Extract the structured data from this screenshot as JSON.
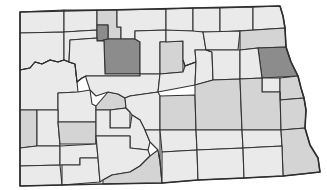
{
  "map": {
    "title": "North Dakota county choropleth",
    "legend_shown": false,
    "labels_shown": false,
    "colors": {
      "level0": "#eaeaea",
      "level1": "#d4d4d4",
      "level2": "#8c8c8c",
      "border": "#333333",
      "background": "#ffffff"
    },
    "counties": [
      {
        "id": "divide",
        "shade": "level0"
      },
      {
        "id": "burke",
        "shade": "level0"
      },
      {
        "id": "renville",
        "shade": "level1"
      },
      {
        "id": "bottineau",
        "shade": "level0"
      },
      {
        "id": "rolette",
        "shade": "level0"
      },
      {
        "id": "towner",
        "shade": "level0"
      },
      {
        "id": "cavalier",
        "shade": "level0"
      },
      {
        "id": "pembina",
        "shade": "level0"
      },
      {
        "id": "williams",
        "shade": "level0"
      },
      {
        "id": "mountrail",
        "shade": "level0"
      },
      {
        "id": "ward-west",
        "shade": "level2"
      },
      {
        "id": "ward",
        "shade": "level2"
      },
      {
        "id": "mchenry",
        "shade": "level0"
      },
      {
        "id": "pierce",
        "shade": "level1"
      },
      {
        "id": "benson",
        "shade": "level0"
      },
      {
        "id": "ramsey",
        "shade": "level0"
      },
      {
        "id": "walsh",
        "shade": "level1"
      },
      {
        "id": "grand-forks",
        "shade": "level2"
      },
      {
        "id": "mckenzie",
        "shade": "level0"
      },
      {
        "id": "dunn",
        "shade": "level0"
      },
      {
        "id": "mercer",
        "shade": "level1"
      },
      {
        "id": "mclean",
        "shade": "level0"
      },
      {
        "id": "sheridan",
        "shade": "level0"
      },
      {
        "id": "wells",
        "shade": "level0"
      },
      {
        "id": "eddy",
        "shade": "level0"
      },
      {
        "id": "nelson",
        "shade": "level0"
      },
      {
        "id": "griggs",
        "shade": "level0"
      },
      {
        "id": "steele",
        "shade": "level0"
      },
      {
        "id": "traill",
        "shade": "level1"
      },
      {
        "id": "golden-valley",
        "shade": "level1"
      },
      {
        "id": "billings",
        "shade": "level0"
      },
      {
        "id": "stark",
        "shade": "level1"
      },
      {
        "id": "oliver",
        "shade": "level0"
      },
      {
        "id": "burleigh",
        "shade": "level0"
      },
      {
        "id": "kidder",
        "shade": "level1"
      },
      {
        "id": "stutsman",
        "shade": "level1"
      },
      {
        "id": "barnes",
        "shade": "level1"
      },
      {
        "id": "cass",
        "shade": "level1"
      },
      {
        "id": "morton",
        "shade": "level0"
      },
      {
        "id": "slope",
        "shade": "level0"
      },
      {
        "id": "hettinger",
        "shade": "level0"
      },
      {
        "id": "bowman",
        "shade": "level0"
      },
      {
        "id": "adams",
        "shade": "level0"
      },
      {
        "id": "grant",
        "shade": "level0"
      },
      {
        "id": "sioux",
        "shade": "level1"
      },
      {
        "id": "emmons",
        "shade": "level0"
      },
      {
        "id": "logan",
        "shade": "level0"
      },
      {
        "id": "lamoure",
        "shade": "level0"
      },
      {
        "id": "ransom",
        "shade": "level0"
      },
      {
        "id": "richland",
        "shade": "level1"
      },
      {
        "id": "mcintosh",
        "shade": "level0"
      },
      {
        "id": "dickey",
        "shade": "level0"
      },
      {
        "id": "sargent",
        "shade": "level0"
      }
    ]
  }
}
